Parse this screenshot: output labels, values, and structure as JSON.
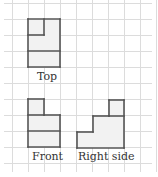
{
  "colors": {
    "grid": "#dcdcdc",
    "outline": "#555555",
    "fill": "#f2f2f2"
  },
  "grid": {
    "x0": 12,
    "y0": 3,
    "cell": 16,
    "cols": 9,
    "rows": 10,
    "xEnd": 152,
    "yEnd": 172
  },
  "views": [
    {
      "name": "Top",
      "label": "Top",
      "label_pos": [
        37,
        71
      ],
      "fill_rects": [
        [
          28,
          19,
          32,
          48
        ]
      ],
      "segments": [
        [
          28,
          19,
          60,
          19
        ],
        [
          60,
          19,
          60,
          67
        ],
        [
          60,
          67,
          28,
          67
        ],
        [
          28,
          67,
          28,
          19
        ],
        [
          44,
          19,
          44,
          35
        ],
        [
          28,
          35,
          44,
          35
        ],
        [
          28,
          51,
          60,
          51
        ]
      ]
    },
    {
      "name": "Front",
      "label": "Front",
      "label_pos": [
        32,
        151
      ],
      "fill_rects": [
        [
          28,
          99,
          16,
          16
        ],
        [
          28,
          115,
          32,
          32
        ]
      ],
      "segments": [
        [
          28,
          99,
          44,
          99
        ],
        [
          44,
          99,
          44,
          115
        ],
        [
          44,
          115,
          60,
          115
        ],
        [
          60,
          115,
          60,
          147
        ],
        [
          60,
          147,
          28,
          147
        ],
        [
          28,
          147,
          28,
          99
        ],
        [
          28,
          115,
          44,
          115
        ],
        [
          28,
          131,
          60,
          131
        ]
      ]
    },
    {
      "name": "Right side",
      "label": "Right side",
      "label_pos": [
        78,
        151
      ],
      "fill_rects": [
        [
          77,
          132,
          16,
          16
        ],
        [
          93,
          116,
          31,
          32
        ],
        [
          109,
          100,
          15,
          16
        ]
      ],
      "segments": [
        [
          77,
          132,
          93,
          132
        ],
        [
          93,
          132,
          93,
          116
        ],
        [
          93,
          116,
          109,
          116
        ],
        [
          109,
          116,
          109,
          100
        ],
        [
          109,
          100,
          124,
          100
        ],
        [
          124,
          100,
          124,
          148
        ],
        [
          124,
          148,
          77,
          148
        ],
        [
          77,
          148,
          77,
          132
        ],
        [
          109,
          116,
          124,
          116
        ]
      ]
    }
  ]
}
